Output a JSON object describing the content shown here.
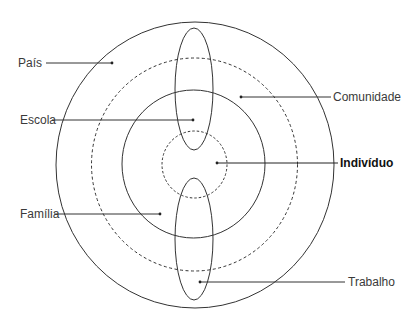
{
  "diagram": {
    "type": "concentric-circles",
    "colors": {
      "stroke": "#333333",
      "text": "#3a3a3a",
      "bold_text": "#111111",
      "background": "#ffffff"
    },
    "labels": {
      "pais": "País",
      "escola": "Escola",
      "familia": "Família",
      "comunidade": "Comunidade",
      "individuo": "Indivíduo",
      "trabalho": "Trabalho"
    },
    "rings": [
      {
        "name": "individuo",
        "style": "dashed"
      },
      {
        "name": "familia",
        "style": "solid"
      },
      {
        "name": "comunidade",
        "style": "dashed"
      },
      {
        "name": "pais",
        "style": "solid"
      }
    ],
    "ellipses": [
      {
        "name": "escola",
        "position": "top"
      },
      {
        "name": "trabalho",
        "position": "bottom"
      }
    ]
  }
}
